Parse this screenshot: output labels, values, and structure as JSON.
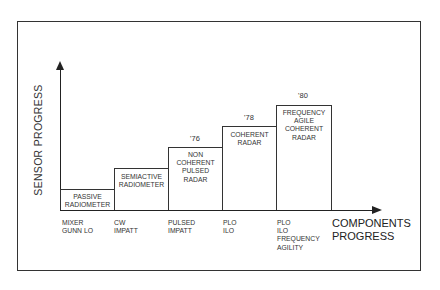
{
  "diagram": {
    "y_axis_label": "SENSOR PROGRESS",
    "x_axis_label": "COMPONENTS\nPROGRESS",
    "steps": [
      {
        "label": "PASSIVE\nRADIOMETER",
        "year": "",
        "components": "MIXER\nGUNN LO"
      },
      {
        "label": "SEMIACTIVE\nRADIOMETER",
        "year": "",
        "components": "CW\nIMPATT"
      },
      {
        "label": "NON\nCOHERENT\nPULSED\nRADAR",
        "year": "'76",
        "components": "PULSED\nIMPATT"
      },
      {
        "label": "COHERENT\nRADAR",
        "year": "'78",
        "components": "PLO\nILO"
      },
      {
        "label": "FREQUENCY\nAGILE\nCOHERENT\nRADAR",
        "year": "'80",
        "components": "PLO\nILO\nFREQUENCY\nAGILITY"
      }
    ]
  }
}
